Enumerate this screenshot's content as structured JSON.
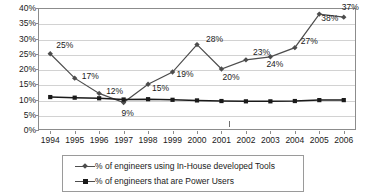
{
  "chart_data": {
    "type": "line",
    "title": "",
    "xlabel": "",
    "ylabel": "",
    "grid": true,
    "legend_position": "bottom",
    "x": [
      "1994",
      "1995",
      "1996",
      "1997",
      "1998",
      "1999",
      "2000",
      "2001",
      "2002",
      "2003",
      "2004",
      "2005",
      "2006"
    ],
    "ylim": [
      0,
      40
    ],
    "yticks": [
      "0%",
      "5%",
      "10%",
      "15%",
      "20%",
      "25%",
      "30%",
      "35%",
      "40%"
    ],
    "ytick_values": [
      0,
      5,
      10,
      15,
      20,
      25,
      30,
      35,
      40
    ],
    "series": [
      {
        "name": "% of engineers using In-House developed Tools",
        "marker": "diamond",
        "color": "#4d4d4d",
        "values": [
          25,
          17,
          12,
          9,
          15,
          19,
          28,
          20,
          23,
          24,
          27,
          38,
          37
        ],
        "labels": [
          "25%",
          "17%",
          "12%",
          "9%",
          "15%",
          "19%",
          "28%",
          "20%",
          "23%",
          "24%",
          "27%",
          "38%",
          "37%"
        ]
      },
      {
        "name": "% of engineers that are Power Users",
        "marker": "square",
        "color": "#1a1a1a",
        "values": [
          10.8,
          10.6,
          10.4,
          10.0,
          10.1,
          9.9,
          9.7,
          9.5,
          9.4,
          9.4,
          9.5,
          9.8,
          9.8
        ],
        "labels": []
      }
    ]
  },
  "legend": {
    "items": [
      {
        "label": "% of engineers using In-House developed Tools"
      },
      {
        "label": "% of engineers that are Power Users"
      }
    ]
  }
}
